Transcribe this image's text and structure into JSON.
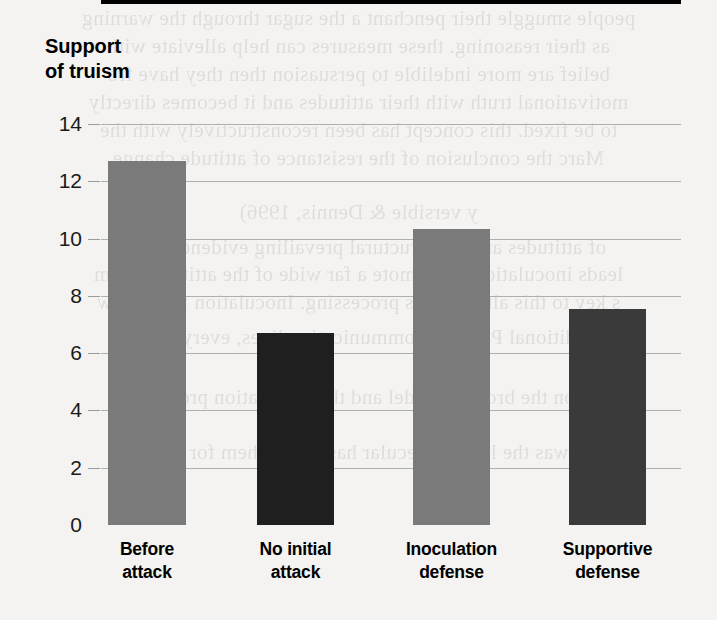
{
  "chart_data": {
    "type": "bar",
    "title": "",
    "xlabel": "",
    "ylabel": "Support of truism",
    "ylabel_lines": [
      "Support",
      "of truism"
    ],
    "categories": [
      "Before attack",
      "No initial attack",
      "Inoculation defense",
      "Supportive defense"
    ],
    "category_lines": [
      [
        "Before",
        "attack"
      ],
      [
        "No initial",
        "attack"
      ],
      [
        "Inoculation",
        "defense"
      ],
      [
        "Supportive",
        "defense"
      ]
    ],
    "values": [
      12.7,
      6.7,
      10.35,
      7.55
    ],
    "bar_colors": [
      "#7a7a7a",
      "#1f1f1f",
      "#7a7a7a",
      "#3a3a3a"
    ],
    "ylim": [
      0,
      14
    ],
    "yticks": [
      0,
      2,
      4,
      6,
      8,
      10,
      12,
      14
    ],
    "ytick_labels": [
      "0",
      "2",
      "4",
      "6",
      "8",
      "10",
      "12",
      "14"
    ],
    "grid": true,
    "grid_color": "#aeb0ad",
    "legend": null,
    "legend_position": "none",
    "background_color": "#f4f3f1",
    "axis_color": "#000000"
  },
  "ghost_text": {
    "lines": [
      "people smuggle their penchant a the sugar through the warning",
      "as their reasoning. these measures can help alleviate with",
      "belief are more indelible to persuasion then they have fro",
      "motivational truth with their attitudes and it becomes directly",
      "to be fixed. this concept has been reconstructively with the",
      "Marc the conclusion of the resistance of attitude change",
      "y versible & Dennis, 1996)",
      "of attitudes and the structural prevailing evidence with a",
      "leads inoculation to promote a far wide of the attitudes from",
      "s key to this alteration is processing. Inoculation few below",
      "traditional Pfau the communication lines, every person",
      "on the broader model and the inoculation process",
      "and was the little molecular has called them for intrinsic"
    ],
    "y_positions": [
      6,
      34,
      62,
      90,
      118,
      146,
      200,
      235,
      262,
      290,
      325,
      385,
      440
    ]
  }
}
